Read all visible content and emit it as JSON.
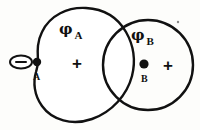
{
  "figure": {
    "kind": "physics-potential-diagram",
    "background_color": "#fdfdfb",
    "ink_color": "#111111",
    "stroke_width": 2.2
  },
  "regions": {
    "left": {
      "name": "region-a",
      "shape": "bean-blob",
      "potential_symbol": "φ",
      "potential_subscript": "A",
      "interior_sign": "+"
    },
    "right": {
      "name": "region-b",
      "shape": "circle",
      "potential_symbol": "φ",
      "potential_subscript": "B",
      "interior_sign": "+"
    }
  },
  "points": {
    "a": {
      "label": "A",
      "charge_symbol": "−",
      "charge_marker": "circled-minus",
      "marker": "filled-dot"
    },
    "b": {
      "label": "B",
      "marker": "filled-dot"
    }
  },
  "artifacts": {
    "speck": "scan-speck"
  }
}
